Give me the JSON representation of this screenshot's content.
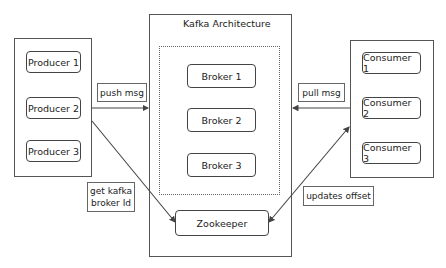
{
  "diagram": {
    "title": "Kafka Architecture",
    "producers": {
      "items": [
        {
          "label": "Producer 1"
        },
        {
          "label": "Producer 2"
        },
        {
          "label": "Producer 3"
        }
      ]
    },
    "brokers": {
      "items": [
        {
          "label": "Broker 1"
        },
        {
          "label": "Broker 2"
        },
        {
          "label": "Broker 3"
        }
      ]
    },
    "zookeeper": {
      "label": "Zookeeper"
    },
    "consumers": {
      "items": [
        {
          "label": "Consumer 1"
        },
        {
          "label": "Consumer 2"
        },
        {
          "label": "Consumer 3"
        }
      ]
    },
    "edges": [
      {
        "from": "Producer 2",
        "to": "Kafka Architecture",
        "label": "push msg"
      },
      {
        "from": "Consumer 2",
        "to": "Kafka Architecture",
        "label": "pull msg"
      },
      {
        "from": "Producer 2",
        "to": "Zookeeper",
        "label": "get kafka broker Id"
      },
      {
        "from": "Zookeeper",
        "to": "Consumers",
        "label": "updates offset",
        "bidirectional": true
      }
    ],
    "edge_labels": {
      "push": "push msg",
      "pull": "pull msg",
      "get_broker_line1": "get kafka",
      "get_broker_line2": "broker Id",
      "updates_offset": "updates offset"
    }
  }
}
